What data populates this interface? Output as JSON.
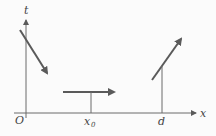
{
  "diagram": {
    "type": "position-time style diagram with velocity arrows",
    "axes": {
      "x_label": "x",
      "y_label": "t",
      "origin_label": "O"
    },
    "markers": [
      {
        "label": "x",
        "subscript": "0",
        "position": "x0"
      },
      {
        "label": "d",
        "position": "d"
      }
    ],
    "arrows": [
      {
        "name": "descending-arrow",
        "description": "diagonal arrow pointing down-right near t-axis"
      },
      {
        "name": "horizontal-arrow",
        "description": "horizontal arrow pointing right above x0"
      },
      {
        "name": "ascending-arrow",
        "description": "diagonal arrow pointing up-right above d"
      }
    ],
    "colors": {
      "line": "#5a5a5a",
      "axis": "#6a6a6a",
      "background": "#fbfbfb"
    }
  }
}
